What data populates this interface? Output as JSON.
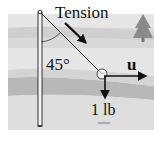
{
  "diagram": {
    "labels": {
      "tension": "Tension",
      "angle": "45°",
      "vector_u": "u",
      "weight": "1 lb"
    },
    "colors": {
      "background": "#ffffff",
      "scene_light": "#e4e4e4",
      "scene_mid": "#d2d2d2",
      "scene_band": "#b4b4b4",
      "tree": "#8a8a8a",
      "ink": "#111111"
    },
    "icons": [
      "pole-icon",
      "rope-icon",
      "ball-icon",
      "tree-icon",
      "tension-arrow-icon",
      "u-arrow-icon",
      "weight-arrow-icon",
      "angle-arc-icon"
    ]
  }
}
